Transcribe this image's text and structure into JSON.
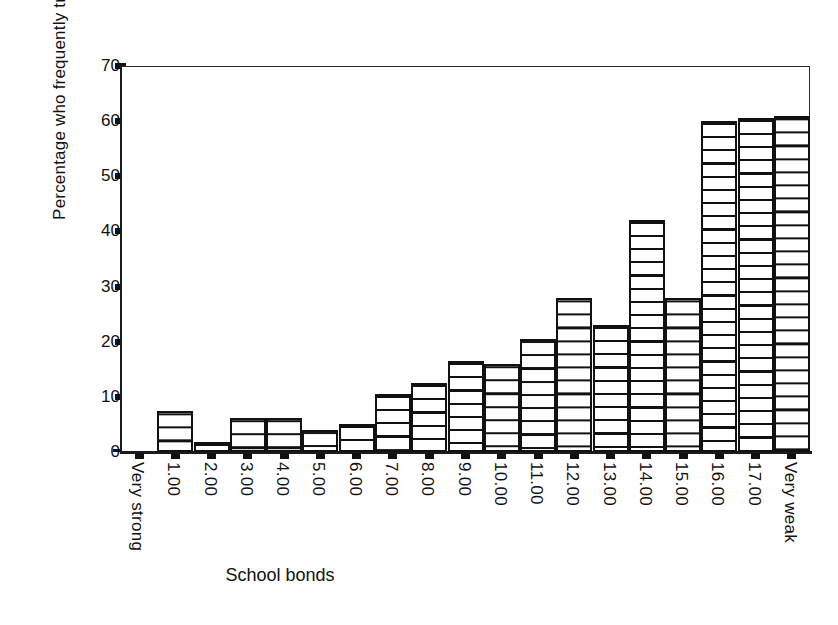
{
  "chart_data": {
    "type": "bar",
    "title": "",
    "xlabel": "School bonds",
    "ylabel": "Percentage who frequently truant (3+ times)",
    "ylim": [
      0,
      70
    ],
    "yticks": [
      0,
      10,
      20,
      30,
      40,
      50,
      60,
      70
    ],
    "grid": false,
    "legend": "none",
    "bar_fill": "horizontal-line-hatch",
    "categories": [
      "Very strong",
      "1.00",
      "2.00",
      "3.00",
      "4.00",
      "5.00",
      "6.00",
      "7.00",
      "8.00",
      "9.00",
      "10.00",
      "11.00",
      "12.00",
      "13.00",
      "14.00",
      "15.00",
      "16.00",
      "17.00",
      "Very weak"
    ],
    "values": [
      0,
      7.5,
      1.8,
      6.2,
      6.2,
      4.0,
      5.0,
      10.5,
      12.5,
      16.5,
      16.0,
      20.5,
      28.0,
      23.0,
      42.0,
      28.0,
      60.0,
      60.5,
      61.0
    ]
  },
  "colors": {
    "axis": "#111111",
    "bar_outline": "#111111",
    "bar_fill": "#ffffff",
    "background": "#ffffff"
  }
}
